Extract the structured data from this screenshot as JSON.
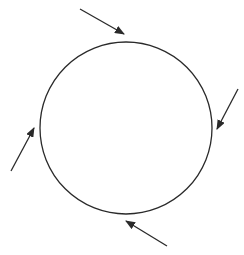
{
  "diagram": {
    "width": 244,
    "height": 255,
    "stroke_color": "#2a2a2a",
    "background": "#ffffff",
    "circle": {
      "cx": 126,
      "cy": 128,
      "r": 86
    },
    "arrows": [
      {
        "name": "arrow-top",
        "x1": 80,
        "y1": 9,
        "x2": 124,
        "y2": 34
      },
      {
        "name": "arrow-right",
        "x1": 238,
        "y1": 89,
        "x2": 217,
        "y2": 129
      },
      {
        "name": "arrow-left",
        "x1": 11,
        "y1": 171,
        "x2": 34,
        "y2": 128
      },
      {
        "name": "arrow-bottom",
        "x1": 167,
        "y1": 246,
        "x2": 126,
        "y2": 221
      }
    ]
  }
}
